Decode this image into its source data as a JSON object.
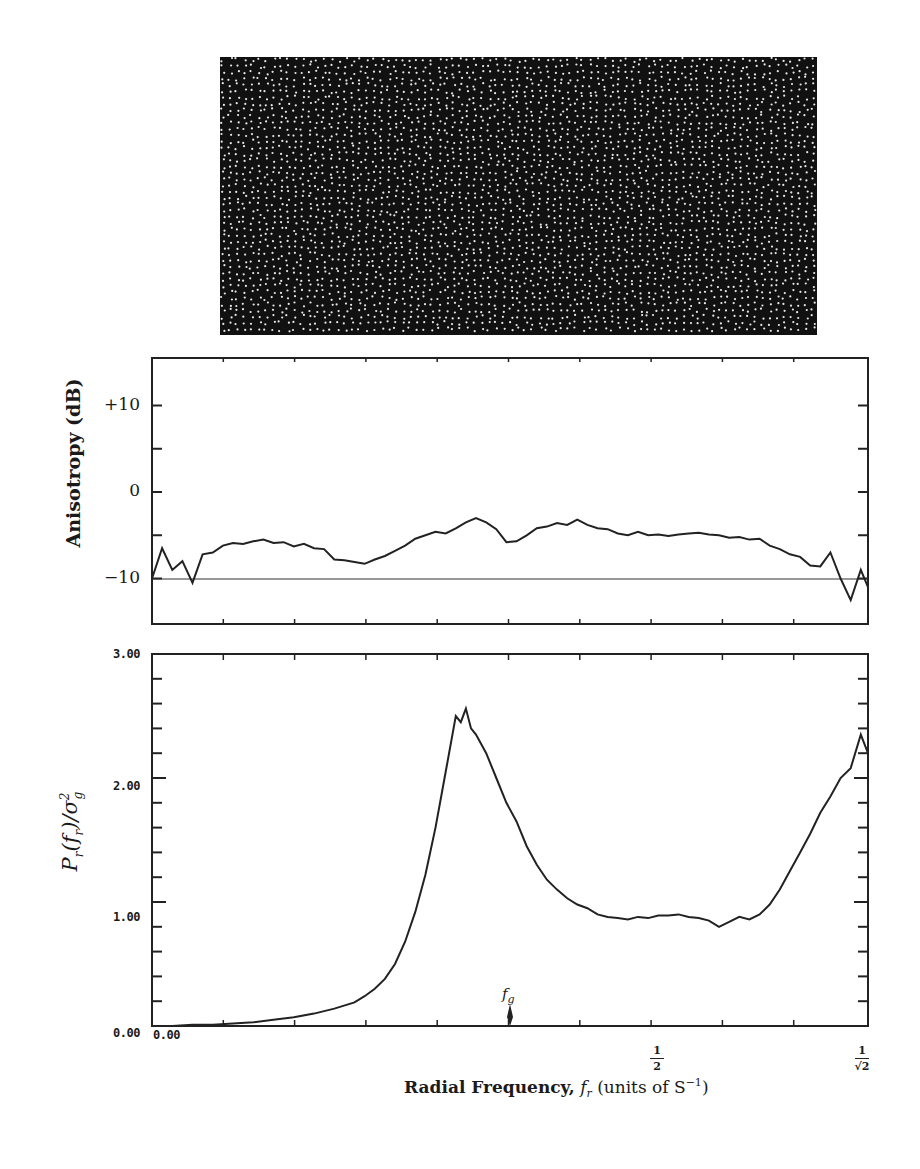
{
  "figure": {
    "image_panel": {
      "description": "blue-noise dot pattern",
      "background": "#111111",
      "dot_color": "#e8e8e8"
    },
    "x_axis": {
      "label_bold": "Radial Frequency,",
      "label_var": "f",
      "label_sub": "r",
      "label_units": "(units of S",
      "label_units_sup": "−1",
      "label_close": ")",
      "tick_origin": "0.00",
      "tick_half_num": "1",
      "tick_half_den": "2",
      "tick_end_num": "1",
      "tick_end_den": "√2",
      "fg_label": "f",
      "fg_sub": "g"
    },
    "anisotropy": {
      "ylabel": "Anisotropy (dB)",
      "ticks": [
        "+10",
        "0",
        "−10"
      ]
    },
    "power": {
      "ylabel_main": "P",
      "ylabel_text": "Pr(fr)/σg²",
      "ticks": [
        "3.00",
        "2.00",
        "1.00",
        "0.00"
      ]
    }
  },
  "chart_data": [
    {
      "type": "line",
      "title": "",
      "xlabel": "Radial Frequency, f_r (units of S^-1)",
      "ylabel": "Anisotropy (dB)",
      "xlim": [
        0,
        0.7071
      ],
      "ylim": [
        -15,
        15
      ],
      "reference_line": -10,
      "x": [
        0.0,
        0.01,
        0.02,
        0.03,
        0.04,
        0.05,
        0.06,
        0.07,
        0.08,
        0.09,
        0.1,
        0.11,
        0.12,
        0.13,
        0.14,
        0.15,
        0.16,
        0.17,
        0.18,
        0.19,
        0.2,
        0.21,
        0.22,
        0.23,
        0.24,
        0.25,
        0.26,
        0.27,
        0.28,
        0.29,
        0.3,
        0.31,
        0.32,
        0.33,
        0.34,
        0.35,
        0.36,
        0.37,
        0.38,
        0.39,
        0.4,
        0.41,
        0.42,
        0.43,
        0.44,
        0.45,
        0.46,
        0.47,
        0.48,
        0.49,
        0.5,
        0.51,
        0.52,
        0.53,
        0.54,
        0.55,
        0.56,
        0.57,
        0.58,
        0.59,
        0.6,
        0.61,
        0.62,
        0.63,
        0.64,
        0.65,
        0.66,
        0.67,
        0.68,
        0.69,
        0.7,
        0.7071
      ],
      "values": [
        -10.0,
        -6.5,
        -9.0,
        -8.0,
        -10.5,
        -7.2,
        -7.0,
        -6.2,
        -5.9,
        -6.0,
        -5.7,
        -5.5,
        -5.9,
        -5.8,
        -6.3,
        -6.0,
        -6.5,
        -6.6,
        -7.8,
        -7.9,
        -8.1,
        -8.3,
        -7.8,
        -7.4,
        -6.8,
        -6.2,
        -5.4,
        -5.0,
        -4.6,
        -4.8,
        -4.2,
        -3.5,
        -3.0,
        -3.5,
        -4.3,
        -5.8,
        -5.7,
        -5.0,
        -4.2,
        -4.0,
        -3.6,
        -3.8,
        -3.2,
        -3.8,
        -4.2,
        -4.3,
        -4.8,
        -5.0,
        -4.6,
        -5.0,
        -4.9,
        -5.1,
        -4.9,
        -4.8,
        -4.7,
        -4.9,
        -5.0,
        -5.3,
        -5.2,
        -5.5,
        -5.4,
        -6.2,
        -6.6,
        -7.2,
        -7.5,
        -8.5,
        -8.6,
        -7.0,
        -10.0,
        -12.5,
        -9.0,
        -11.0
      ]
    },
    {
      "type": "line",
      "title": "",
      "xlabel": "Radial Frequency, f_r (units of S^-1)",
      "ylabel": "P_r(f_r)/σ_g²",
      "xlim": [
        0,
        0.7071
      ],
      "ylim": [
        0,
        3
      ],
      "annotation": {
        "label": "f_g",
        "x": 0.3125
      },
      "x": [
        0.0,
        0.02,
        0.04,
        0.06,
        0.08,
        0.1,
        0.12,
        0.14,
        0.16,
        0.18,
        0.2,
        0.21,
        0.22,
        0.23,
        0.24,
        0.25,
        0.26,
        0.27,
        0.28,
        0.29,
        0.3,
        0.305,
        0.31,
        0.315,
        0.32,
        0.33,
        0.34,
        0.35,
        0.36,
        0.37,
        0.38,
        0.39,
        0.4,
        0.41,
        0.42,
        0.43,
        0.44,
        0.45,
        0.46,
        0.47,
        0.48,
        0.49,
        0.5,
        0.51,
        0.52,
        0.53,
        0.54,
        0.55,
        0.56,
        0.57,
        0.58,
        0.59,
        0.6,
        0.61,
        0.62,
        0.63,
        0.64,
        0.65,
        0.66,
        0.67,
        0.68,
        0.69,
        0.7,
        0.7071
      ],
      "values": [
        0.0,
        0.0,
        0.01,
        0.01,
        0.02,
        0.03,
        0.05,
        0.07,
        0.1,
        0.14,
        0.19,
        0.24,
        0.3,
        0.38,
        0.5,
        0.68,
        0.92,
        1.22,
        1.6,
        2.05,
        2.5,
        2.45,
        2.56,
        2.4,
        2.35,
        2.2,
        2.0,
        1.8,
        1.65,
        1.45,
        1.3,
        1.18,
        1.1,
        1.03,
        0.98,
        0.95,
        0.9,
        0.88,
        0.87,
        0.86,
        0.88,
        0.87,
        0.89,
        0.89,
        0.9,
        0.88,
        0.87,
        0.85,
        0.8,
        0.84,
        0.88,
        0.86,
        0.9,
        0.98,
        1.1,
        1.25,
        1.4,
        1.55,
        1.72,
        1.85,
        2.0,
        2.08,
        2.35,
        2.2
      ]
    }
  ]
}
